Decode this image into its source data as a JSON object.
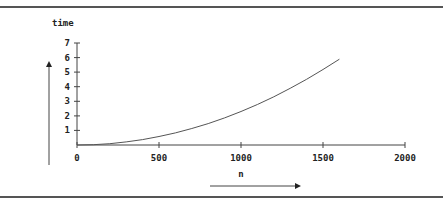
{
  "chart_data": {
    "type": "line",
    "title": "",
    "xlabel": "n",
    "ylabel": "time",
    "xlim": [
      0,
      2000
    ],
    "ylim": [
      0,
      7
    ],
    "x_ticks": [
      "0",
      "500",
      "1000",
      "1500",
      "2000"
    ],
    "y_ticks": [
      "1",
      "2",
      "3",
      "4",
      "5",
      "6",
      "7"
    ],
    "grid": false,
    "legend": null,
    "series": [
      {
        "name": "time",
        "x": [
          0,
          100,
          200,
          300,
          400,
          500,
          600,
          700,
          800,
          900,
          1000,
          1100,
          1200,
          1300,
          1400,
          1500,
          1600
        ],
        "values": [
          0.0,
          0.02,
          0.09,
          0.21,
          0.37,
          0.58,
          0.83,
          1.13,
          1.47,
          1.86,
          2.3,
          2.78,
          3.31,
          3.89,
          4.51,
          5.18,
          5.89
        ]
      }
    ],
    "annotations": [
      "upward arrow beside y-axis",
      "rightward arrow below x-axis label"
    ]
  },
  "labels": {
    "y_axis": "time",
    "x_axis": "n",
    "x0": "0",
    "x500": "500",
    "x1000": "1000",
    "x1500": "1500",
    "x2000": "2000",
    "y1": "1",
    "y2": "2",
    "y3": "3",
    "y4": "4",
    "y5": "5",
    "y6": "6",
    "y7": "7"
  },
  "colors": {
    "axis": "#444444",
    "curve": "#555555",
    "frame": "#555555"
  }
}
